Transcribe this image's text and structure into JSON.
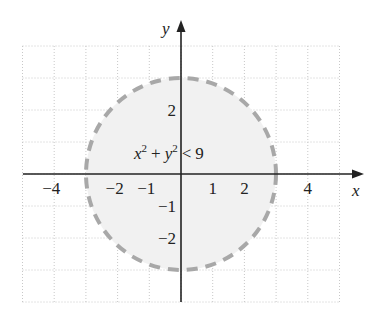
{
  "diagram": {
    "inequality": {
      "base1": "x",
      "exp1": "2",
      "plus": "+",
      "base2": "y",
      "exp2": "2",
      "rel": "<",
      "rhs": "9"
    },
    "axes": {
      "x_label": "x",
      "y_label": "y"
    },
    "x_ticks": [
      {
        "value": -4,
        "label": "−4"
      },
      {
        "value": -2,
        "label": "−2"
      },
      {
        "value": -1,
        "label": "−1"
      },
      {
        "value": 1,
        "label": "1"
      },
      {
        "value": 2,
        "label": "2"
      },
      {
        "value": 4,
        "label": "4"
      }
    ],
    "y_ticks": [
      {
        "value": 2,
        "label": "2"
      },
      {
        "value": -1,
        "label": "−1"
      },
      {
        "value": -2,
        "label": "−2"
      }
    ],
    "grid": {
      "x_min": -5,
      "x_max": 5,
      "y_min": -4,
      "y_max": 4
    },
    "circle": {
      "radius": 3,
      "style": "dashed",
      "fill": "shaded"
    },
    "colors": {
      "circle_stroke": "#a8a8a8",
      "region_fill": "#f1f1f1",
      "grid": "#c8c8c8",
      "axis": "#222222"
    }
  }
}
